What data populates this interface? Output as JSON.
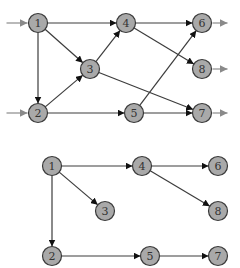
{
  "graphs": [
    {
      "name": "dependency-graph",
      "nodes": [
        {
          "id": "1",
          "label": "1"
        },
        {
          "id": "2",
          "label": "2"
        },
        {
          "id": "3",
          "label": "3"
        },
        {
          "id": "4",
          "label": "4"
        },
        {
          "id": "5",
          "label": "5"
        },
        {
          "id": "6",
          "label": "6"
        },
        {
          "id": "7",
          "label": "7"
        },
        {
          "id": "8",
          "label": "8"
        }
      ],
      "edges": [
        [
          "1",
          "4"
        ],
        [
          "1",
          "3"
        ],
        [
          "1",
          "2"
        ],
        [
          "2",
          "3"
        ],
        [
          "3",
          "4"
        ],
        [
          "2",
          "5"
        ],
        [
          "4",
          "6"
        ],
        [
          "4",
          "8"
        ],
        [
          "3",
          "7"
        ],
        [
          "5",
          "6"
        ],
        [
          "5",
          "7"
        ]
      ],
      "inputs": [
        "1",
        "2"
      ],
      "outputs": [
        "6",
        "8",
        "7"
      ]
    },
    {
      "name": "spanning-tree",
      "nodes": [
        {
          "id": "1",
          "label": "1"
        },
        {
          "id": "2",
          "label": "2"
        },
        {
          "id": "3",
          "label": "3"
        },
        {
          "id": "4",
          "label": "4"
        },
        {
          "id": "5",
          "label": "5"
        },
        {
          "id": "6",
          "label": "6"
        },
        {
          "id": "7",
          "label": "7"
        },
        {
          "id": "8",
          "label": "8"
        }
      ],
      "edges": [
        [
          "1",
          "4"
        ],
        [
          "1",
          "3"
        ],
        [
          "1",
          "2"
        ],
        [
          "4",
          "6"
        ],
        [
          "4",
          "8"
        ],
        [
          "2",
          "5"
        ],
        [
          "5",
          "7"
        ]
      ],
      "inputs": [],
      "outputs": []
    }
  ],
  "colors": {
    "node_fill": "#a9a9a9",
    "node_stroke": "#3a3a3a",
    "edge": "#3c3c3c",
    "io_arrow": "#8a8a8a"
  }
}
